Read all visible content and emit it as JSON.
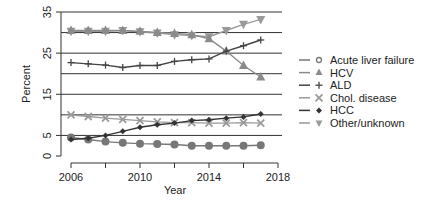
{
  "chart_data": {
    "type": "line",
    "title": "",
    "xlabel": "Year",
    "ylabel": "Percent",
    "x": [
      2006,
      2007,
      2008,
      2009,
      2010,
      2011,
      2012,
      2013,
      2014,
      2015,
      2016,
      2017
    ],
    "xlim": [
      2006,
      2018
    ],
    "ylim": [
      0,
      35
    ],
    "x_ticks": [
      2006,
      2008,
      2010,
      2012,
      2014,
      2016,
      2018
    ],
    "x_tick_labels": [
      "2006",
      "2010",
      "2014",
      "2018"
    ],
    "y_ticks": [
      0,
      5,
      15,
      25,
      35
    ],
    "y_tick_labels": [
      "0",
      "5",
      "15",
      "25",
      "35"
    ],
    "gridlines": [
      5,
      10,
      15,
      20,
      25,
      30,
      35
    ],
    "grid": "horizontal",
    "legend_position": "right",
    "series": [
      {
        "name": "Acute liver failure",
        "marker": "circle",
        "color": "#777777",
        "values": [
          4.5,
          4.0,
          3.5,
          3.2,
          3.0,
          2.9,
          2.8,
          2.5,
          2.5,
          2.5,
          2.5,
          2.6
        ]
      },
      {
        "name": "HCV",
        "marker": "triangle-up",
        "color": "#8a8a8a",
        "values": [
          30.5,
          30.5,
          30.5,
          30.5,
          30.3,
          30.0,
          29.8,
          29.5,
          28.5,
          25.5,
          22.0,
          19.2
        ]
      },
      {
        "name": "ALD",
        "marker": "plus",
        "color": "#444444",
        "values": [
          22.7,
          22.4,
          22.1,
          21.5,
          22.0,
          22.0,
          23.0,
          23.4,
          23.6,
          25.5,
          26.8,
          28.2
        ]
      },
      {
        "name": "Chol. disease",
        "marker": "x",
        "color": "#9a9a9a",
        "values": [
          10.0,
          9.6,
          9.2,
          8.9,
          8.6,
          8.3,
          8.1,
          8.1,
          8.0,
          8.0,
          8.1,
          8.0
        ]
      },
      {
        "name": "HCC",
        "marker": "diamond",
        "color": "#333333",
        "values": [
          4.0,
          4.3,
          5.0,
          6.0,
          7.0,
          7.6,
          8.0,
          8.6,
          8.8,
          9.2,
          9.5,
          10.2
        ]
      },
      {
        "name": "Other/unknown",
        "marker": "triangle-down",
        "color": "#9a9a9a",
        "values": [
          30.3,
          30.3,
          30.3,
          30.5,
          30.2,
          29.9,
          29.5,
          29.3,
          29.0,
          30.5,
          32.0,
          33.2
        ]
      }
    ]
  }
}
